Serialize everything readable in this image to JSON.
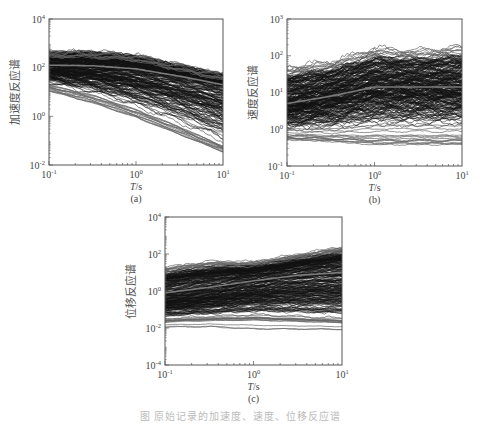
{
  "figure": {
    "caption": "图  原始记录的加速度、速度、位移反应谱"
  },
  "colors": {
    "records": "#111111",
    "mean": "#7a7a7a",
    "axis": "#555555",
    "outlier": "#666666"
  },
  "chart_data": [
    {
      "id": "a",
      "type": "line",
      "sublabel": "(a)",
      "title": "",
      "xlabel": "T/s",
      "ylabel": "加速度反应谱",
      "xscale": "log",
      "yscale": "log",
      "xlim": [
        0.1,
        10
      ],
      "ylim": [
        0.01,
        10000
      ],
      "xticks": [
        "10^-1",
        "10^0",
        "10^1"
      ],
      "yticks": [
        "10^-2",
        "10^0",
        "10^2",
        "10^4"
      ],
      "box": {
        "x": 49,
        "y": 19,
        "w": 174,
        "h": 146
      },
      "x_log": [
        -1,
        -0.5,
        0,
        0.5,
        1
      ],
      "series": [
        {
          "name": "upper envelope",
          "log10_values": [
            2.7,
            2.7,
            2.55,
            2.15,
            1.75
          ]
        },
        {
          "name": "mean",
          "log10_values": [
            2.1,
            2.08,
            1.95,
            1.65,
            1.3
          ]
        },
        {
          "name": "lower envelope (dense)",
          "log10_values": [
            1.3,
            0.9,
            0.3,
            -0.4,
            -1.2
          ]
        },
        {
          "name": "lowest records",
          "log10_values": [
            1.0,
            0.5,
            -0.1,
            -0.8,
            -1.5
          ]
        }
      ],
      "record_count_approx": 300
    },
    {
      "id": "b",
      "type": "line",
      "sublabel": "(b)",
      "title": "",
      "xlabel": "T/s",
      "ylabel": "速度反应谱",
      "xscale": "log",
      "yscale": "log",
      "xlim": [
        0.1,
        10
      ],
      "ylim": [
        0.1,
        1000
      ],
      "xticks": [
        "10^-1",
        "10^0",
        "10^1"
      ],
      "yticks": [
        "10^-1",
        "10^0",
        "10^1",
        "10^2",
        "10^3"
      ],
      "box": {
        "x": 287,
        "y": 19,
        "w": 175,
        "h": 147
      },
      "x_log": [
        -1,
        -0.5,
        0,
        0.5,
        1
      ],
      "series": [
        {
          "name": "upper envelope",
          "log10_values": [
            1.7,
            1.85,
            2.2,
            2.15,
            2.25
          ]
        },
        {
          "name": "mean",
          "log10_values": [
            0.7,
            0.9,
            1.15,
            1.15,
            1.15
          ]
        },
        {
          "name": "lower envelope (dense)",
          "log10_values": [
            0.0,
            0.0,
            0.1,
            0.1,
            0.1
          ]
        },
        {
          "name": "lowest records",
          "log10_values": [
            -0.3,
            -0.35,
            -0.45,
            -0.45,
            -0.45
          ]
        }
      ],
      "record_count_approx": 300
    },
    {
      "id": "c",
      "type": "line",
      "sublabel": "(c)",
      "title": "",
      "xlabel": "T/s",
      "ylabel": "位移反应谱",
      "xscale": "log",
      "yscale": "log",
      "xlim": [
        0.1,
        10
      ],
      "ylim": [
        0.0001,
        10000
      ],
      "xticks": [
        "10^-1",
        "10^0",
        "10^1"
      ],
      "yticks": [
        "10^-4",
        "10^-2",
        "10^0",
        "10^2",
        "10^4"
      ],
      "box": {
        "x": 165,
        "y": 217,
        "w": 177,
        "h": 148
      },
      "x_log": [
        -1,
        -0.5,
        0,
        0.5,
        1
      ],
      "series": [
        {
          "name": "upper envelope",
          "log10_values": [
            1.3,
            1.6,
            1.6,
            2.0,
            2.4
          ]
        },
        {
          "name": "mean",
          "log10_values": [
            -0.1,
            0.2,
            0.55,
            0.85,
            1.0
          ]
        },
        {
          "name": "lower envelope (dense)",
          "log10_values": [
            -1.5,
            -1.4,
            -1.3,
            -1.4,
            -1.5
          ]
        },
        {
          "name": "lowest records",
          "log10_values": [
            -2.0,
            -2.0,
            -2.15,
            -2.15,
            -2.15
          ]
        }
      ],
      "record_count_approx": 300
    }
  ]
}
